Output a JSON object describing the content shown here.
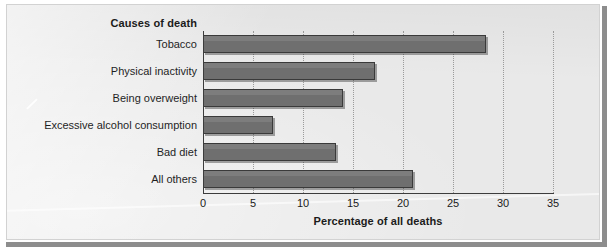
{
  "figure": {
    "series_title": "Causes of death",
    "axis_title": "Percentage of all deaths",
    "bar_color": "#6f6f6f",
    "panel_color": "#e9e9e9",
    "frame_color": "#8d8d8d"
  },
  "chart_data": {
    "type": "bar",
    "orientation": "horizontal",
    "title": "Causes of death",
    "xlabel": "Percentage of all deaths",
    "ylabel": "",
    "xlim": [
      0,
      35
    ],
    "xticks": [
      0,
      5,
      10,
      15,
      20,
      25,
      30,
      35
    ],
    "xtick_labels": [
      "0",
      "5",
      "10",
      "15",
      "20",
      "25",
      "30",
      "35"
    ],
    "grid": "vertical-dotted",
    "legend": "none",
    "categories": [
      "Tobacco",
      "Physical inactivity",
      "Being overweight",
      "Excessive alcohol consumption",
      "Bad diet",
      "All others"
    ],
    "values": [
      28.3,
      17.2,
      14.0,
      7.0,
      13.3,
      21.0
    ],
    "series": [
      {
        "name": "Percentage of all deaths",
        "values": [
          28.3,
          17.2,
          14.0,
          7.0,
          13.3,
          21.0
        ]
      }
    ]
  }
}
